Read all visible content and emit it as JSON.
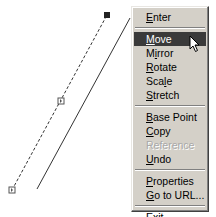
{
  "drawing": {
    "selected_line": {
      "style": "dashed",
      "start": [
        12,
        190
      ],
      "end": [
        107,
        15
      ],
      "grips": [
        {
          "name": "end-grip",
          "pos": [
            107,
            15
          ],
          "state": "hot"
        },
        {
          "name": "mid-grip",
          "pos": [
            61,
            101
          ],
          "state": "cold"
        },
        {
          "name": "start-grip",
          "pos": [
            12,
            190
          ],
          "state": "cold"
        }
      ]
    },
    "preview_line": {
      "style": "solid",
      "start": [
        37,
        189
      ],
      "end": [
        130,
        18
      ]
    }
  },
  "context_menu": {
    "groups": [
      [
        {
          "label": "Enter",
          "mnemonic": "E",
          "state": "normal"
        }
      ],
      [
        {
          "label": "Move",
          "mnemonic": "M",
          "state": "highlighted"
        },
        {
          "label": "Mirror",
          "mnemonic": "i",
          "state": "normal"
        },
        {
          "label": "Rotate",
          "mnemonic": "R",
          "state": "normal"
        },
        {
          "label": "Scale",
          "mnemonic": "l",
          "state": "normal"
        },
        {
          "label": "Stretch",
          "mnemonic": "S",
          "state": "normal"
        }
      ],
      [
        {
          "label": "Base Point",
          "mnemonic": "B",
          "state": "normal"
        },
        {
          "label": "Copy",
          "mnemonic": "C",
          "state": "normal"
        },
        {
          "label": "Reference",
          "mnemonic": "",
          "state": "disabled"
        },
        {
          "label": "Undo",
          "mnemonic": "U",
          "state": "normal"
        }
      ],
      [
        {
          "label": "Properties",
          "mnemonic": "P",
          "state": "normal"
        },
        {
          "label": "Go to URL...",
          "mnemonic": "G",
          "state": "normal"
        }
      ],
      [
        {
          "label": "Exit",
          "mnemonic": "x",
          "state": "normal"
        }
      ]
    ]
  },
  "colors": {
    "menu_bg": "#d4d0c8",
    "highlight_bg": "#3a3a3a",
    "highlight_text": "#ffffff",
    "disabled_text": "#a8a8a8"
  }
}
